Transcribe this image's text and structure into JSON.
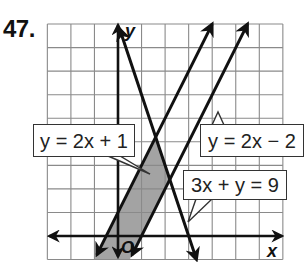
{
  "problem": {
    "number": "47."
  },
  "axes": {
    "x_label": "x",
    "y_label": "y",
    "origin_label": "O"
  },
  "labels": {
    "line1": "y = 2x + 1",
    "line2": "y = 2x − 2",
    "line3": "3x + y = 9"
  },
  "colors": {
    "grid": "#8a8a8a",
    "line": "#111111",
    "shade": "#9e9e9e",
    "label_border": "#333333"
  },
  "chart_data": {
    "type": "line",
    "title": "47.",
    "xlabel": "x",
    "ylabel": "y",
    "xlim": [
      -3,
      7
    ],
    "ylim": [
      -1,
      9
    ],
    "grid": true,
    "grid_step": 1,
    "series": [
      {
        "name": "y = 2x + 1",
        "slope": 2,
        "intercept": 1,
        "points": [
          [
            -1,
            -1
          ],
          [
            4,
            9
          ]
        ]
      },
      {
        "name": "y = 2x − 2",
        "slope": 2,
        "intercept": -2,
        "points": [
          [
            0.5,
            -1
          ],
          [
            5.5,
            9
          ]
        ]
      },
      {
        "name": "3x + y = 9",
        "slope": -3,
        "intercept": 9,
        "points": [
          [
            0,
            9
          ],
          [
            3.333,
            -1
          ]
        ]
      }
    ],
    "shaded_region": {
      "description": "Region between y = 2x − 2 and y = 2x + 1, below 3x + y = 9",
      "vertices": [
        [
          -1,
          -1
        ],
        [
          1.6,
          4.2
        ],
        [
          2.2,
          2.4
        ],
        [
          0.5,
          -1
        ]
      ]
    },
    "annotations": [
      {
        "text": "y = 2x + 1",
        "points_to": "y = 2x + 1"
      },
      {
        "text": "y = 2x − 2",
        "points_to": "y = 2x − 2"
      },
      {
        "text": "3x + y = 9",
        "points_to": "3x + y = 9"
      }
    ]
  }
}
